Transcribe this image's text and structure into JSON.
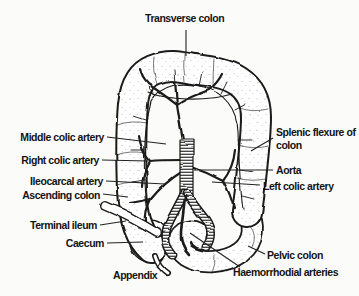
{
  "figure": {
    "colors": {
      "ink": "#1a1a1a",
      "background": "#fbfbfa",
      "label_text": "#141414"
    },
    "labels": {
      "transverse_colon": "Transverse colon",
      "middle_colic_artery": "Middle colic artery",
      "right_colic_artery": "Right colic artery",
      "ileocarcal_artery": "Ileocarcal artery",
      "ascending_colon": "Ascending colon",
      "terminal_ileum": "Terminal ileum",
      "caecum": "Caecum",
      "appendix": "Appendix",
      "splenic_flexure_of_colon": "Splenic flexure of colon",
      "aorta": "Aorta",
      "left_colic_artery": "Left colic artery",
      "pelvic_colon": "Pelvic colon",
      "haemorrhodial_arteries": "Haemorrhodial arteries"
    }
  }
}
